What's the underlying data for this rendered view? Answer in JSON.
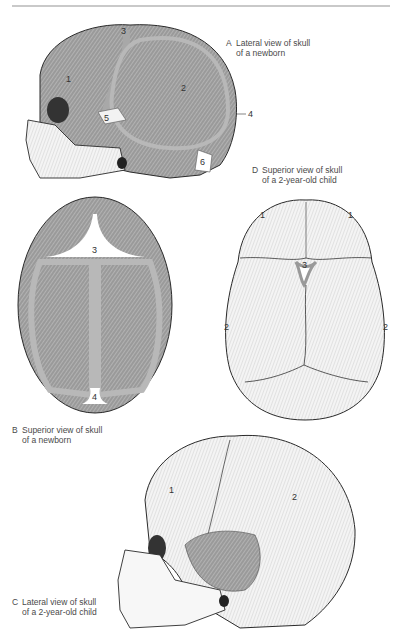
{
  "figure": {
    "panels": [
      {
        "letter": "A",
        "line1": "Lateral view of skull",
        "line2": "of a newborn",
        "labels": [
          "1",
          "2",
          "3",
          "4",
          "5",
          "6"
        ]
      },
      {
        "letter": "B",
        "line1": "Superior view of skull",
        "line2": "of a newborn",
        "labels": [
          "3",
          "4"
        ]
      },
      {
        "letter": "C",
        "line1": "Lateral view of skull",
        "line2": "of a 2-year-old child",
        "labels": [
          "1",
          "2"
        ]
      },
      {
        "letter": "D",
        "line1": "Superior view of skull",
        "line2": "of a 2-year-old child",
        "labels": [
          "1",
          "1",
          "2",
          "2",
          "3"
        ]
      }
    ],
    "colors": {
      "bone_gray": "#8f8f8f",
      "suture_gray": "#a8a8a8",
      "fontanelle": "#ffffff",
      "outline": "#2a2a2a",
      "light_bone": "#e8e8e8"
    }
  }
}
